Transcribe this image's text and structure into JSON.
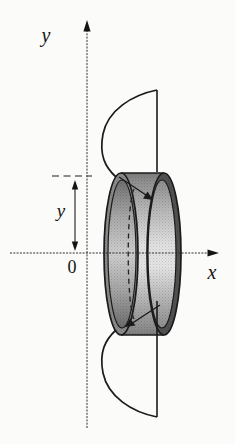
{
  "figure": {
    "type": "calculus-solid-of-revolution-diagram",
    "labels": {
      "y_axis": "y",
      "x_axis": "x",
      "origin": "0",
      "shell_radius": "y"
    },
    "colors": {
      "background": "#fbfbf9",
      "line": "#1b1b1b",
      "axis": "#2e2e2e",
      "shell_top_dark": "#7c7c7c",
      "shell_mid_light": "#e2e2e2",
      "ring_left": "#8a8a8a",
      "ring_right": "#525252",
      "hole_mid": "#cfcfcf"
    }
  }
}
